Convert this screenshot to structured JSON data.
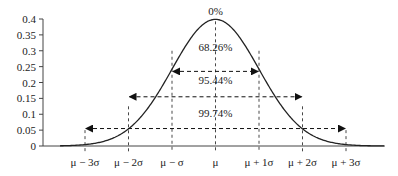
{
  "chart_data": {
    "type": "line",
    "title": "",
    "xlabel": "",
    "ylabel": "",
    "ylim": [
      0,
      0.4
    ],
    "y_ticks": [
      "0",
      "0.05",
      "0.1",
      "0.15",
      "0.2",
      "0.25",
      "0.3",
      "0.35",
      "0.4"
    ],
    "x_ticks": [
      "μ − 3σ",
      "μ − 2σ",
      "μ − σ",
      "μ",
      "μ + 1σ",
      "μ + 2σ",
      "μ + 3σ"
    ],
    "series": [
      {
        "name": "Normal distribution density",
        "x": [
          -4,
          -3,
          -2,
          -1,
          0,
          1,
          2,
          3,
          4
        ],
        "values": [
          0.0001,
          0.0044,
          0.054,
          0.242,
          0.399,
          0.242,
          0.054,
          0.0044,
          0.0001
        ]
      }
    ],
    "annotations": [
      {
        "text": "0%",
        "position": "peak at μ"
      },
      {
        "text": "68.26%",
        "range": [
          "μ − σ",
          "μ + σ"
        ]
      },
      {
        "text": "95.44%",
        "range": [
          "μ − 2σ",
          "μ + 2σ"
        ]
      },
      {
        "text": "99.74%",
        "range": [
          "μ − 3σ",
          "μ + 3σ"
        ]
      }
    ],
    "grid": false,
    "legend": "none"
  },
  "labels": {
    "peak": "0%",
    "band1": "68.26%",
    "band2": "95.44%",
    "band3": "99.74%"
  }
}
